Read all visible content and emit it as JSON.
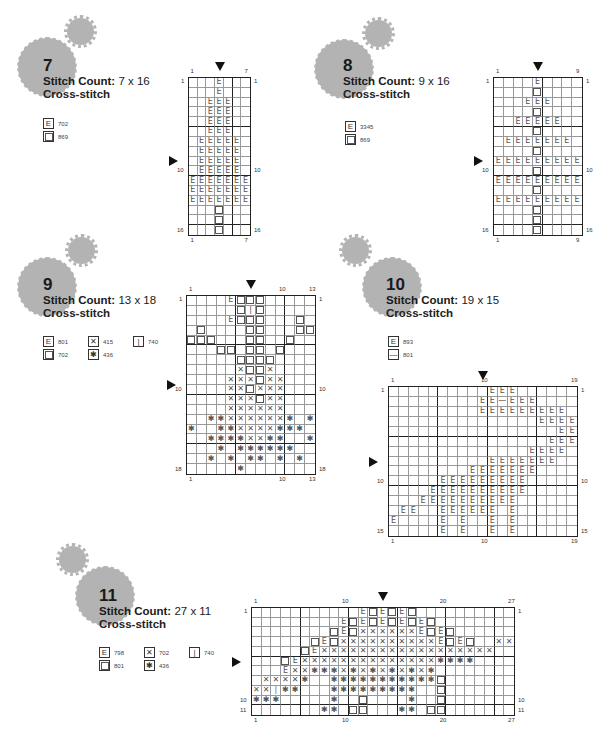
{
  "symbols_key": {
    ".": "empty",
    "E": "E-symbol",
    "O": "square-symbol",
    "X": "x-symbol",
    "*": "star-symbol",
    "I": "bar-symbol",
    "-": "dash-symbol"
  },
  "patterns": [
    {
      "number": "7",
      "stitch_count_label": "Stitch Count:",
      "stitch_count_value": "7 x 16",
      "type": "Cross-stitch",
      "legend": [
        {
          "symbol": "E",
          "code": "702"
        },
        {
          "symbol": "O",
          "code": "869"
        }
      ],
      "cols": 7,
      "rows": 16,
      "top_labels": [
        "1",
        "7"
      ],
      "bottom_labels": [
        "1",
        "7"
      ],
      "left_labels": [
        "1",
        "10",
        "16"
      ],
      "right_labels": [
        "1",
        "10",
        "16"
      ],
      "grid": [
        "...E...",
        "...E...",
        "..EEE..",
        "..EEE..",
        "..EEE..",
        "..EEE..",
        ".EEEEE.",
        ".EEEEE.",
        ".EEEEE.",
        ".EEEEE.",
        "EEEEEEE",
        "EEEEEEE",
        "EEEEEEE",
        "...O...",
        "...O...",
        "...O..."
      ]
    },
    {
      "number": "8",
      "stitch_count_label": "Stitch Count:",
      "stitch_count_value": "9 x 16",
      "type": "Cross-stitch",
      "legend": [
        {
          "symbol": "E",
          "code": "3345"
        },
        {
          "symbol": "O",
          "code": "869"
        }
      ],
      "cols": 9,
      "rows": 16,
      "top_labels": [
        "1",
        "9"
      ],
      "bottom_labels": [
        "1",
        "9"
      ],
      "left_labels": [
        "1",
        "10",
        "16"
      ],
      "right_labels": [
        "1",
        "10",
        "16"
      ],
      "grid": [
        "....E....",
        "....O....",
        "...EEE...",
        "....O....",
        "..EEEEE..",
        "....O....",
        ".EEEEEEE.",
        "....O....",
        "EEEEEEEEE",
        "....O....",
        "EEEEEEEEE",
        "....O....",
        "EEEEEEEEE",
        "....O....",
        "....O....",
        "....O...."
      ]
    },
    {
      "number": "9",
      "stitch_count_label": "Stitch Count:",
      "stitch_count_value": "13 x 18",
      "type": "Cross-stitch",
      "legend": [
        {
          "symbol": "E",
          "code": "801"
        },
        {
          "symbol": "X",
          "code": "415"
        },
        {
          "symbol": "I",
          "code": "740"
        },
        {
          "symbol": "O",
          "code": "702"
        },
        {
          "symbol": "*",
          "code": "436"
        }
      ],
      "cols": 13,
      "rows": 18,
      "top_labels": [
        "1",
        "10",
        "13"
      ],
      "bottom_labels": [
        "1",
        "10",
        "13"
      ],
      "left_labels": [
        "1",
        "10",
        "18"
      ],
      "right_labels": [
        "1",
        "10",
        "18"
      ],
      "grid": [
        "....EOOO.....",
        ".....OIO.....",
        "....EOOO...O.",
        ".O....OO...OO",
        "OOO...OO..O..",
        "...OO.OO.O...",
        ".....OOOO....",
        ".....XOOX....",
        "....XXXOXX...",
        "....XXOXXX...",
        "....XXXOXX...",
        "....XXXXXX...",
        "..**XXXXXX*.*",
        "*..**XXXX***.",
        "..****XX**..*",
        "...*.******..",
        "..*.*.**.*.*.",
        ".....*......."
      ]
    },
    {
      "number": "10",
      "stitch_count_label": "Stitch Count:",
      "stitch_count_value": "19 x 15",
      "type": "Cross-stitch",
      "legend": [
        {
          "symbol": "E",
          "code": "893"
        },
        {
          "symbol": "-",
          "code": "801"
        }
      ],
      "cols": 19,
      "rows": 15,
      "top_labels": [
        "1",
        "10",
        "19"
      ],
      "bottom_labels": [
        "1",
        "10",
        "19"
      ],
      "left_labels": [
        "1",
        "10",
        "15"
      ],
      "right_labels": [
        "1",
        "10",
        "15"
      ],
      "grid": [
        "..........EEE......",
        ".........EE-EEE....",
        ".........EEEEEEEEE.",
        "...............EEEE",
        ".................EE",
        "................EEE",
        "..............EEEE.",
        "..........EEEEEEE..",
        "........EEEEEEE....",
        ".....EEEEEEEEE.....",
        "....EEEEEEEEEE.....",
        "...EEEEEEEEEE......",
        ".EE..EEEEEE.E......",
        "E....E.E..E.E......",
        ".....E.E..E.E......"
      ]
    },
    {
      "number": "11",
      "stitch_count_label": "Stitch Count:",
      "stitch_count_value": "27 x 11",
      "type": "Cross-stitch",
      "legend": [
        {
          "symbol": "E",
          "code": "798"
        },
        {
          "symbol": "X",
          "code": "702"
        },
        {
          "symbol": "I",
          "code": "740"
        },
        {
          "symbol": "O",
          "code": "801"
        },
        {
          "symbol": "*",
          "code": "436"
        }
      ],
      "cols": 27,
      "rows": 11,
      "top_labels": [
        "1",
        "10",
        "20",
        "27"
      ],
      "bottom_labels": [
        "1",
        "10",
        "20",
        "27"
      ],
      "left_labels": [
        "1",
        "10",
        "11"
      ],
      "right_labels": [
        "1",
        "10",
        "11"
      ],
      "grid": [
        "...........EOEOEO..........",
        ".........EOEOEOEOEO........",
        "........OEOXXXXXXEOEO......",
        "......OEOXXXXXXXXXXEOEO..XX",
        ".....OEXXXXXXXXXXXXXXXXXX..",
        "...OEXXXXXXXXXXXXXX****....",
        "...EXX***X*X*X*X*X*........",
        ".XXXX*..***********O.......",
        "XXI**...*********..O.......",
        "***.....*..O....*..O.......",
        ".......**.OO...**.OO......."
      ]
    }
  ]
}
